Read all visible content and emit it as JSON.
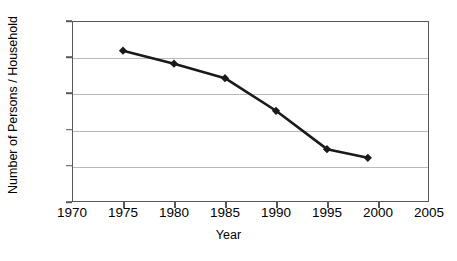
{
  "chart_data": {
    "type": "line",
    "title": "",
    "xlabel": "Year",
    "ylabel": "Number of Persons / Household",
    "x": [
      1975,
      1980,
      1985,
      1990,
      1995,
      1999
    ],
    "values": [
      6.09,
      5.91,
      5.71,
      5.26,
      4.73,
      4.61
    ],
    "series": [
      {
        "name": "Persons per Household",
        "x": [
          1975,
          1980,
          1985,
          1990,
          1995,
          1999
        ],
        "values": [
          6.09,
          5.91,
          5.71,
          5.26,
          4.73,
          4.61
        ]
      }
    ],
    "xlim": [
      1970,
      2005
    ],
    "ylim": [
      4.0,
      6.5
    ],
    "xticks": [
      1970,
      1975,
      1980,
      1985,
      1990,
      1995,
      2000,
      2005
    ],
    "yticks": [
      4.0,
      4.5,
      5.0,
      5.5,
      6.0,
      6.5
    ],
    "xtick_labels": [
      "1970",
      "1975",
      "1980",
      "1985",
      "1990",
      "1995",
      "2000",
      "2005"
    ],
    "ytick_labels": [
      "4.00",
      "4.50",
      "5.00",
      "5.50",
      "6.00",
      "6.50"
    ],
    "grid": "horizontal",
    "legend": "none",
    "marker": "diamond",
    "line_color": "#1a1a1a",
    "marker_color": "#1a1a1a",
    "grid_color": "#b9b9bb",
    "axis_color": "#58585a",
    "background": "#ffffff"
  }
}
